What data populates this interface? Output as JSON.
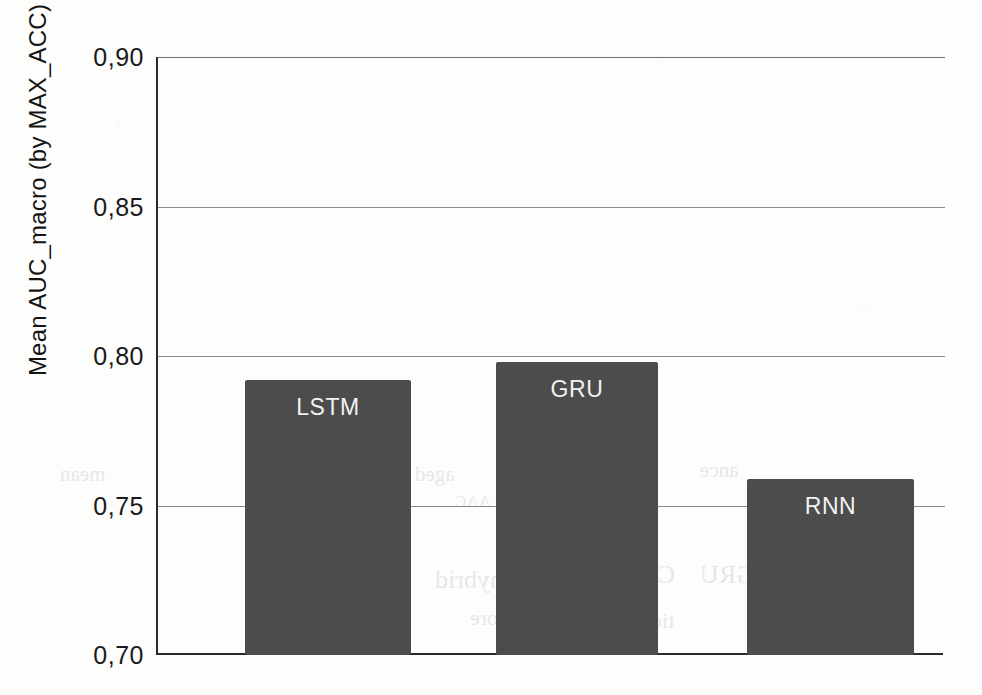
{
  "chart_data": {
    "type": "bar",
    "title": "",
    "subtitle": "",
    "xlabel": "",
    "ylabel": "Mean AUC_macro (by MAX_ACC)",
    "categories": [
      "LSTM",
      "GRU",
      "RNN"
    ],
    "values": [
      0.792,
      0.798,
      0.759
    ],
    "ylim": [
      0.7,
      0.9
    ],
    "yticks": [
      0.9,
      0.85,
      0.8,
      0.75,
      0.7
    ],
    "ytick_labels": [
      "0,90",
      "0,85",
      "0,80",
      "0,75",
      "0,70"
    ],
    "decimal_separator": ",",
    "grid": true,
    "grid_axis": "y",
    "legend": false,
    "legend_position": "none",
    "xtick_labels": [],
    "bar_labels_inside": true,
    "bar_color": "#4c4c4c",
    "grid_color": "#8a8a8a",
    "axis_color": "#2b2b2b",
    "background_color": "#fdfdfc",
    "label_text_color": "#f2f2f2"
  },
  "axis": {
    "y_title": "Mean AUC_macro (by MAX_ACC)",
    "ticks": [
      {
        "label": "0,90",
        "value": 0.9
      },
      {
        "label": "0,85",
        "value": 0.85
      },
      {
        "label": "0,80",
        "value": 0.8
      },
      {
        "label": "0,75",
        "value": 0.75
      },
      {
        "label": "0,70",
        "value": 0.7
      }
    ]
  },
  "bars": [
    {
      "label": "LSTM",
      "value": 0.792
    },
    {
      "label": "GRU",
      "value": 0.798
    },
    {
      "label": "RNN",
      "value": 0.759
    }
  ],
  "page_bleed": [
    {
      "text": "mean",
      "x": 60,
      "y": 462,
      "size": 21
    },
    {
      "text": "aged",
      "x": 415,
      "y": 462,
      "size": 21
    },
    {
      "text": "ance",
      "x": 700,
      "y": 458,
      "size": 21
    },
    {
      "text": "AAC",
      "x": 455,
      "y": 492,
      "size": 17
    },
    {
      "text": "hybrid",
      "x": 435,
      "y": 565,
      "size": 26
    },
    {
      "text": "CNN",
      "x": 620,
      "y": 560,
      "size": 26
    },
    {
      "text": "GRU",
      "x": 700,
      "y": 560,
      "size": 26
    },
    {
      "text": "more",
      "x": 470,
      "y": 605,
      "size": 22
    },
    {
      "text": "tion",
      "x": 640,
      "y": 608,
      "size": 22
    }
  ]
}
